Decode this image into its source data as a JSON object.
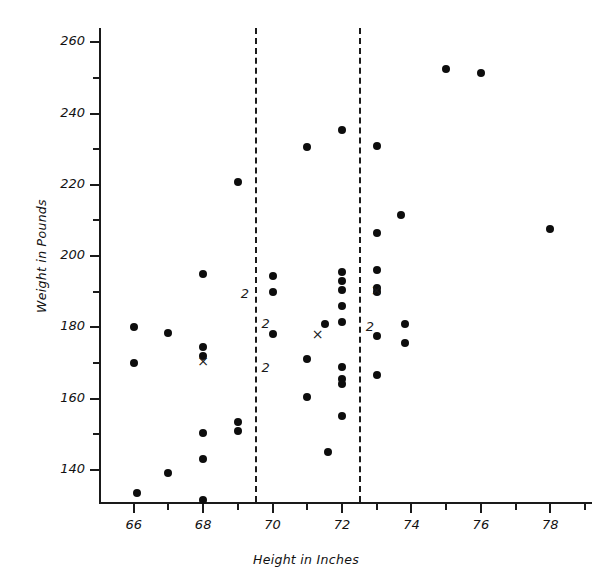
{
  "chart_data": {
    "type": "scatter",
    "title": "",
    "xlabel": "Height in Inches",
    "ylabel": "Weight in Pounds",
    "xlim": [
      65.0,
      79.2
    ],
    "ylim": [
      131,
      264
    ],
    "xticks": [
      66,
      68,
      70,
      72,
      74,
      76,
      78
    ],
    "xtick_labels": [
      "66",
      "68",
      "70",
      "72",
      "74",
      "76",
      "78"
    ],
    "x_minor_ticks": [
      65,
      67,
      69,
      71,
      73,
      75,
      77,
      79
    ],
    "yticks": [
      140,
      160,
      180,
      200,
      220,
      240,
      260
    ],
    "ytick_labels": [
      "140",
      "160",
      "180",
      "200",
      "220",
      "240",
      "260"
    ],
    "y_minor_ticks": [
      150,
      170,
      190,
      210,
      230,
      250
    ],
    "grid": false,
    "legend": "none",
    "reference_lines": [
      {
        "name": "lower-divider",
        "x": 69.5,
        "style": "dashed"
      },
      {
        "name": "upper-divider",
        "x": 72.5,
        "style": "dashed"
      }
    ],
    "points": [
      {
        "x": 66.0,
        "y": 180.0
      },
      {
        "x": 66.0,
        "y": 170.0
      },
      {
        "x": 67.0,
        "y": 178.5
      },
      {
        "x": 67.0,
        "y": 139.0
      },
      {
        "x": 66.1,
        "y": 133.5
      },
      {
        "x": 68.0,
        "y": 195.0
      },
      {
        "x": 68.0,
        "y": 174.5
      },
      {
        "x": 68.0,
        "y": 172.0
      },
      {
        "x": 68.0,
        "y": 150.5
      },
      {
        "x": 68.0,
        "y": 143.0
      },
      {
        "x": 68.0,
        "y": 131.5
      },
      {
        "x": 69.0,
        "y": 220.8
      },
      {
        "x": 69.0,
        "y": 153.5
      },
      {
        "x": 69.0,
        "y": 150.8
      },
      {
        "x": 70.0,
        "y": 194.5
      },
      {
        "x": 70.0,
        "y": 190.0
      },
      {
        "x": 70.0,
        "y": 178.0
      },
      {
        "x": 71.0,
        "y": 230.5
      },
      {
        "x": 71.0,
        "y": 171.0
      },
      {
        "x": 71.0,
        "y": 160.5
      },
      {
        "x": 71.5,
        "y": 181.0
      },
      {
        "x": 72.0,
        "y": 235.5
      },
      {
        "x": 72.0,
        "y": 195.5
      },
      {
        "x": 72.0,
        "y": 193.0
      },
      {
        "x": 72.0,
        "y": 190.5
      },
      {
        "x": 72.0,
        "y": 186.0
      },
      {
        "x": 72.0,
        "y": 181.5
      },
      {
        "x": 72.0,
        "y": 169.0
      },
      {
        "x": 72.0,
        "y": 165.5
      },
      {
        "x": 72.0,
        "y": 164.0
      },
      {
        "x": 72.0,
        "y": 155.0
      },
      {
        "x": 71.6,
        "y": 145.0
      },
      {
        "x": 73.0,
        "y": 231.0
      },
      {
        "x": 73.0,
        "y": 206.5
      },
      {
        "x": 73.0,
        "y": 196.0
      },
      {
        "x": 73.0,
        "y": 191.0
      },
      {
        "x": 73.0,
        "y": 190.0
      },
      {
        "x": 73.0,
        "y": 177.5
      },
      {
        "x": 73.0,
        "y": 166.5
      },
      {
        "x": 73.7,
        "y": 211.5
      },
      {
        "x": 73.8,
        "y": 181.0
      },
      {
        "x": 73.8,
        "y": 175.5
      },
      {
        "x": 75.0,
        "y": 252.5
      },
      {
        "x": 76.0,
        "y": 251.5
      },
      {
        "x": 78.0,
        "y": 207.5
      }
    ],
    "x_markers": [
      {
        "x": 68.0,
        "y": 170.5
      },
      {
        "x": 71.3,
        "y": 178.0
      },
      {
        "x": 73.0,
        "y": 190.5
      }
    ],
    "count_labels": [
      {
        "x": 69.2,
        "y": 189.5,
        "text": "2"
      },
      {
        "x": 69.8,
        "y": 181.0,
        "text": "2"
      },
      {
        "x": 69.8,
        "y": 168.5,
        "text": "2"
      },
      {
        "x": 72.8,
        "y": 180.0,
        "text": "2"
      }
    ]
  }
}
